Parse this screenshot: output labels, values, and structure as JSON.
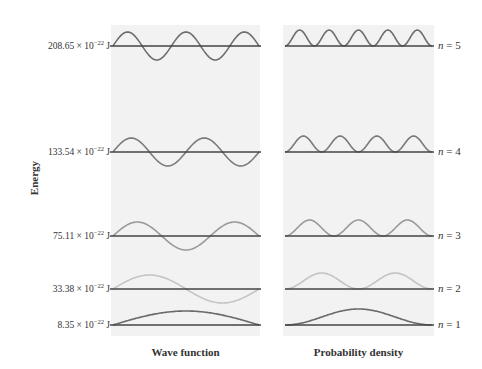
{
  "chart_data": {
    "type": "diagram",
    "ylabel": "Energy",
    "panels": [
      {
        "name": "Wave function",
        "xlabel": "Wave function"
      },
      {
        "name": "Probability density",
        "xlabel": "Probability density"
      }
    ],
    "levels": [
      {
        "n": 5,
        "energy": "208.65 × 10^-22 J",
        "energy_value": 208.65,
        "baseline_y": 46,
        "color": "#6e6e6e"
      },
      {
        "n": 4,
        "energy": "133.54 × 10^-22 J",
        "energy_value": 133.54,
        "baseline_y": 152,
        "color": "#7a7a7a"
      },
      {
        "n": 3,
        "energy": "75.11 × 10^-22 J",
        "energy_value": 75.11,
        "baseline_y": 236,
        "color": "#999999"
      },
      {
        "n": 2,
        "energy": "33.38 × 10^-22 J",
        "energy_value": 33.38,
        "baseline_y": 289,
        "color": "#c4c4c4"
      },
      {
        "n": 1,
        "energy": "8.35 × 10^-22 J",
        "energy_value": 8.35,
        "baseline_y": 325,
        "color": "#6a6a6a"
      }
    ]
  },
  "labels": {
    "energy_axis": "Energy",
    "x_left": "Wave function",
    "x_right": "Probability density",
    "unit_prefix": "× 10",
    "unit_exp": "−22",
    "unit": "J",
    "n_prefix": "n",
    "equals": " = "
  },
  "energies": [
    "208.65",
    "133.54",
    "75.11",
    "33.38",
    "8.35"
  ],
  "n_values": [
    "5",
    "4",
    "3",
    "2",
    "1"
  ]
}
